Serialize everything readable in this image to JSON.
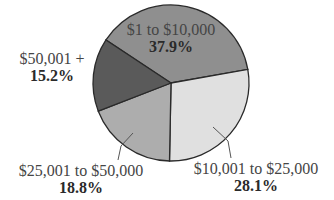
{
  "chart_data": {
    "type": "pie",
    "title": "",
    "start_angle_deg": -10,
    "direction": "clockwise",
    "categories": [
      "$1 to $10,000",
      "$10,001 to $25,000",
      "$25,001 to $50,000",
      "$50,001 +"
    ],
    "values": [
      37.9,
      28.1,
      18.8,
      15.2
    ],
    "value_labels": [
      "37.9%",
      "28.1%",
      "18.8%",
      "15.2%"
    ],
    "colors": [
      "#8f8f8f",
      "#e0e0e0",
      "#adadad",
      "#5a5a5a"
    ],
    "legend": "none",
    "labels_position": [
      "inside",
      "outside-bottom-right",
      "outside-bottom-left",
      "outside-left"
    ]
  },
  "labels": [
    {
      "name": "$1 to $10,000",
      "pct": "37.9%"
    },
    {
      "name": "$10,001 to $25,000",
      "pct": "28.1%"
    },
    {
      "name": "$25,001 to $50,000",
      "pct": "18.8%"
    },
    {
      "name": "$50,001 +",
      "pct": "15.2%"
    }
  ]
}
